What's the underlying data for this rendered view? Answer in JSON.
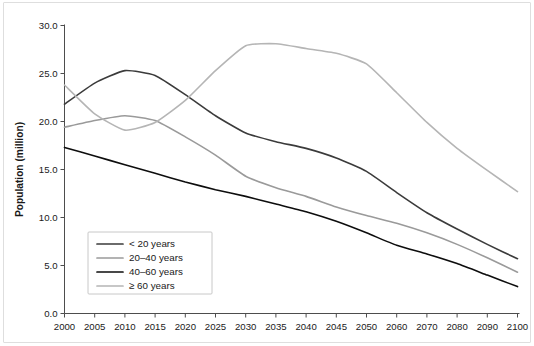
{
  "chart_data": {
    "type": "line",
    "title": "",
    "xlabel": "",
    "ylabel": "Population (million)",
    "ylim": [
      0.0,
      30.0
    ],
    "yticks": [
      "0.0",
      "5.0",
      "10.0",
      "15.0",
      "20.0",
      "25.0",
      "30.0"
    ],
    "ytick_values": [
      0.0,
      5.0,
      10.0,
      15.0,
      20.0,
      25.0,
      30.0
    ],
    "grid": false,
    "legend_position": "lower left",
    "categories": [
      "2000",
      "2005",
      "2010",
      "2015",
      "2020",
      "2025",
      "2030",
      "2035",
      "2040",
      "2045",
      "2050",
      "2060",
      "2070",
      "2080",
      "2090",
      "2100"
    ],
    "x": [
      2000,
      2005,
      2010,
      2015,
      2020,
      2025,
      2030,
      2035,
      2040,
      2045,
      2050,
      2060,
      2070,
      2080,
      2090,
      2100
    ],
    "series": [
      {
        "name": "< 20 years",
        "color": "#3b3b3b",
        "width": 1.6,
        "values": [
          21.8,
          24.0,
          25.3,
          24.8,
          22.8,
          20.6,
          18.8,
          17.9,
          17.2,
          16.2,
          14.8,
          12.6,
          10.5,
          8.8,
          7.2,
          5.7
        ]
      },
      {
        "name": "20–40 years",
        "color": "#9a9a9a",
        "width": 1.6,
        "values": [
          19.4,
          20.1,
          20.6,
          20.1,
          18.4,
          16.5,
          14.3,
          13.1,
          12.2,
          11.1,
          10.2,
          9.4,
          8.4,
          7.2,
          5.8,
          4.3
        ]
      },
      {
        "name": "40–60 years",
        "color": "#0d0d0d",
        "width": 1.6,
        "values": [
          17.3,
          16.4,
          15.5,
          14.6,
          13.7,
          12.9,
          12.2,
          11.4,
          10.6,
          9.6,
          8.4,
          7.1,
          6.2,
          5.2,
          4.0,
          2.8
        ]
      },
      {
        "name": "≥ 60 years",
        "color": "#b5b5b5",
        "width": 1.6,
        "values": [
          23.8,
          20.8,
          19.1,
          19.9,
          22.2,
          25.3,
          27.9,
          28.1,
          27.6,
          27.1,
          26.0,
          23.0,
          19.9,
          17.2,
          14.9,
          12.7
        ]
      }
    ],
    "legend_entries": [
      {
        "label": "< 20 years",
        "color": "#3b3b3b"
      },
      {
        "label": "20–40 years",
        "color": "#9a9a9a"
      },
      {
        "label": "40–60 years",
        "color": "#0d0d0d"
      },
      {
        "label": "≥ 60 years",
        "color": "#b5b5b5"
      }
    ]
  },
  "figure": {
    "background": "#ffffff",
    "border_color": "#dedede",
    "axis_color": "#4d4d4d",
    "text_color": "#1a1a1a"
  }
}
